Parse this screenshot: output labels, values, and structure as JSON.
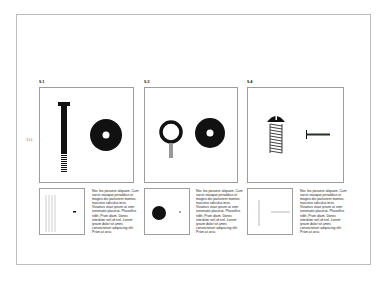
{
  "page": {
    "number": "114"
  },
  "figures": [
    {
      "label": "9.1",
      "objects": [
        "bolt",
        "washer"
      ],
      "thumb": [
        "vertical-lines",
        "small-mark"
      ],
      "caption": "Nec leo posuere aliquam. Cum sociis natoque penatibus et magnis dis parturient montes, nascetur ridiculus mus. Vivamus vitae ipsum at sem venenatis placerat. Phasellus nibh. Proin diam. Donec interdum nisl id nisl. Lorem ipsum dolor sit amet, consectetuer adipiscing elit. Proin at arcu."
    },
    {
      "label": "9.3",
      "objects": [
        "eye-hook",
        "washer"
      ],
      "thumb": [
        "filled-circle",
        "dot"
      ],
      "caption": "Nec leo posuere aliquam. Cum sociis natoque penatibus et magnis dis parturient montes, nascetur ridiculus mus. Vivamus vitae ipsum at sem venenatis placerat. Phasellus nibh. Proin diam. Donec interdum nisl id nisl. Lorem ipsum dolor sit amet, consectetuer adipiscing elit. Proin at arcu."
    },
    {
      "label": "9.4",
      "objects": [
        "screw",
        "nail"
      ],
      "thumb": [
        "vertical-line",
        "horizontal-line"
      ],
      "caption": "Nec leo posuere aliquam. Cum sociis natoque penatibus et magnis dis parturient montes, nascetur ridiculus mus. Vivamus vitae ipsum at sem venenatis placerat. Phasellus nibh. Proin diam. Donec interdum nisl id nisl. Lorem ipsum dolor sit amet, consectetuer adipiscing elit. Proin at arcu."
    }
  ]
}
